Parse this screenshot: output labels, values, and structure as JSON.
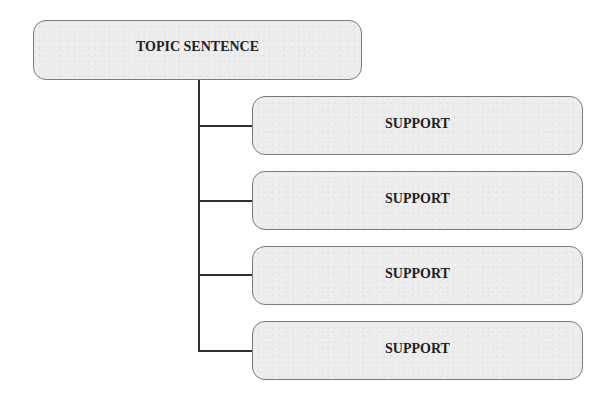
{
  "diagram": {
    "type": "hierarchy",
    "topic": {
      "label": "TOPIC SENTENCE"
    },
    "supports": [
      {
        "label": "SUPPORT"
      },
      {
        "label": "SUPPORT"
      },
      {
        "label": "SUPPORT"
      },
      {
        "label": "SUPPORT"
      }
    ],
    "colors": {
      "box_fill": "#ececec",
      "box_border": "#7a7a7a",
      "connector": "#2f2f2f",
      "text": "#1e1e1e"
    }
  }
}
